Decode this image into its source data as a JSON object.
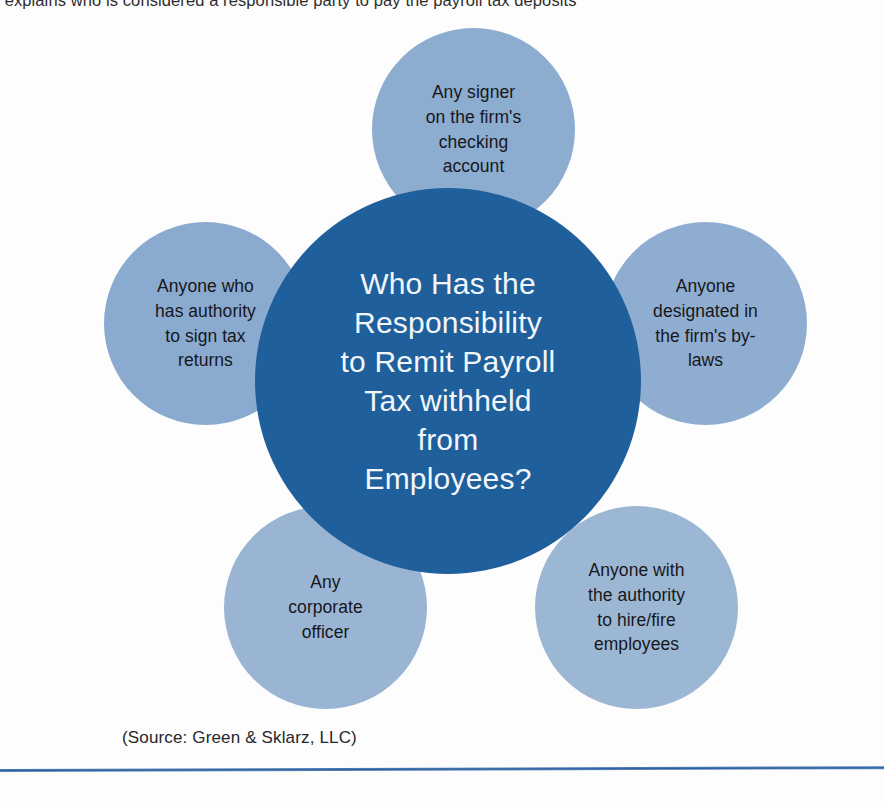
{
  "page": {
    "top_running_text": "gram explains who is considered a responsible party to pay the payroll tax deposits",
    "source_caption": "(Source: Green & Sklarz, LLC)"
  },
  "colors": {
    "center_fill": "#1f5f9b",
    "satellite_fill": "#8cacd0",
    "center_text": "#f2f6fa",
    "satellite_text": "#17171c",
    "rule": "#2d5f9e",
    "background": "#fdfdfd"
  },
  "chart_data": {
    "type": "diagram",
    "layout": "hub-and-spoke",
    "title": "Who Has the Responsibility to Remit Payroll Tax withheld from Employees?",
    "center": {
      "id": "center-question",
      "label": "Who Has the\nResponsibility\nto Remit Payroll\nTax withheld\nfrom\nEmployees?",
      "fill": "#1f5f9b"
    },
    "nodes": [
      {
        "id": "node-signer",
        "position": "top",
        "label": "Any signer\non the firm's\nchecking\naccount",
        "fill": "#8cacd0"
      },
      {
        "id": "node-sign-tax-returns",
        "position": "left",
        "label": "Anyone who\nhas authority\nto sign tax\nreturns",
        "fill": "#8aaacf"
      },
      {
        "id": "node-bylaws",
        "position": "right",
        "label": "Anyone\ndesignated in\nthe firm's by-\nlaws",
        "fill": "#8fadd1"
      },
      {
        "id": "node-corporate-officer",
        "position": "bottom-left",
        "label": "Any\ncorporate\nofficer",
        "fill": "#9ab5d3"
      },
      {
        "id": "node-hire-fire",
        "position": "bottom-right",
        "label": "Anyone with\nthe authority\nto hire/fire\nemployees",
        "fill": "#9cb7d4"
      }
    ]
  }
}
